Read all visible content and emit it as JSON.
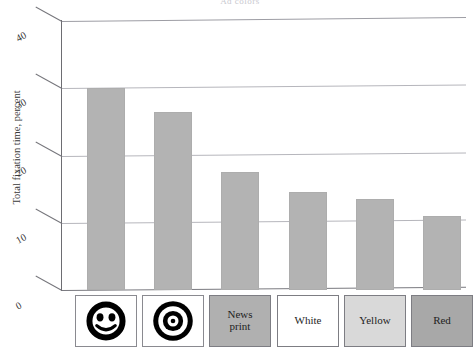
{
  "chart_data": {
    "type": "bar",
    "title": "Ad colors",
    "xlabel": "",
    "ylabel": "Total fixation time, percent",
    "ylim": [
      0,
      40
    ],
    "yticks": [
      "0",
      "10",
      "20",
      "30",
      "40"
    ],
    "grid": true,
    "legend": "none",
    "bar_color": "#b3b3b3",
    "categories": [
      "Face",
      "Bullseye",
      "News print",
      "White",
      "Yellow",
      "Red"
    ],
    "category_labels": [
      "",
      "",
      "News\nprint",
      "White",
      "Yellow",
      "Red"
    ],
    "values": [
      30,
      26.5,
      17.5,
      14.5,
      13.5,
      11
    ],
    "category_swatch_colors": [
      "#ffffff",
      "#ffffff",
      "#b0b0b0",
      "#ffffff",
      "#d9d9d9",
      "#a8a8a8"
    ],
    "category_icons": [
      "smiley-face-icon",
      "bullseye-icon",
      "",
      "",
      "",
      ""
    ]
  },
  "axis": {
    "y_title": "Total fixation time, percent",
    "ticks": [
      {
        "label": "40",
        "value": 40
      },
      {
        "label": "30",
        "value": 30
      },
      {
        "label": "20",
        "value": 20
      },
      {
        "label": "10",
        "value": 10
      },
      {
        "label": "0",
        "value": 0
      }
    ]
  },
  "categories": [
    {
      "label": "",
      "icon": "smiley-face-icon",
      "swatch": "#ffffff"
    },
    {
      "label": "",
      "icon": "bullseye-icon",
      "swatch": "#ffffff"
    },
    {
      "label": "News print",
      "icon": "",
      "swatch": "#b0b0b0"
    },
    {
      "label": "White",
      "icon": "",
      "swatch": "#ffffff"
    },
    {
      "label": "Yellow",
      "icon": "",
      "swatch": "#d9d9d9"
    },
    {
      "label": "Red",
      "icon": "",
      "swatch": "#a8a8a8"
    }
  ]
}
